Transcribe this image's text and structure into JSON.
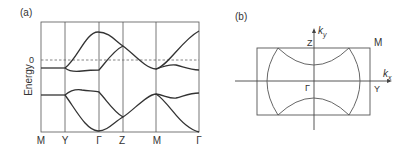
{
  "panel_a": {
    "label": "(a)",
    "ylabel": "Energy",
    "zero_tick": "0",
    "x_ticks": [
      "M",
      "Y",
      "Γ",
      "Z",
      "M",
      "Γ"
    ],
    "description": "Band structure along M–Y–Γ–Z–M–Γ with Fermi level (dashed) at 0"
  },
  "panel_b": {
    "label": "(b)",
    "ky_label": "k",
    "ky_sub": "y",
    "kx_label": "k",
    "kx_sub": "x",
    "point_Z": "Z",
    "point_M": "M",
    "point_Y": "Y",
    "point_G": "Γ",
    "description": "Rectangular Brillouin zone with Fermi surface arcs"
  },
  "colors": {
    "line": "#333333",
    "grid": "#555555",
    "dash": "#666666"
  }
}
